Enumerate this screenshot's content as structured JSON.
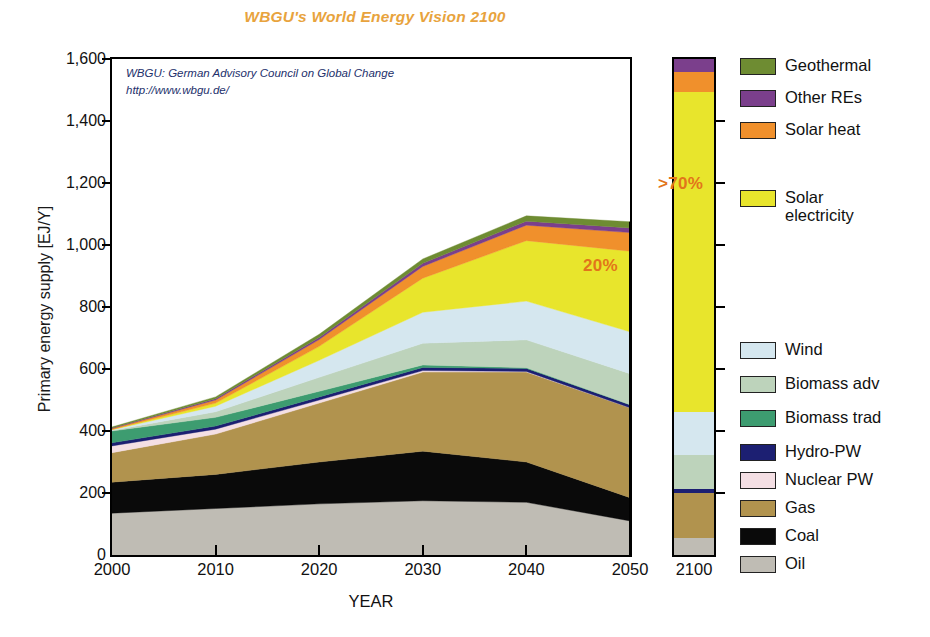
{
  "chart_data": {
    "type": "area",
    "title": "WBGU's World Energy Vision 2100",
    "xlabel": "YEAR",
    "ylabel": "Primary energy supply [EJ/Y]",
    "ylim": [
      0,
      1600
    ],
    "ytick_labels": [
      "0",
      "200",
      "400",
      "600",
      "800",
      "1,000",
      "1,200",
      "1,400",
      "1,600"
    ],
    "ytick_values": [
      0,
      200,
      400,
      600,
      800,
      1000,
      1200,
      1400,
      1600
    ],
    "xtick_labels": [
      "2000",
      "2010",
      "2020",
      "2030",
      "2040",
      "2050"
    ],
    "x": [
      2000,
      2010,
      2020,
      2030,
      2040,
      2050
    ],
    "grid": false,
    "legend_position": "right",
    "stack_order_bottom_to_top": [
      "Oil",
      "Coal",
      "Gas",
      "Nuclear PW",
      "Hydro-PW",
      "Biomass trad",
      "Biomass adv",
      "Wind",
      "Solar electricity",
      "Solar heat",
      "Other REs",
      "Geothermal"
    ],
    "series": [
      {
        "name": "Oil",
        "color": "#bfbcb4",
        "values": [
          135,
          150,
          165,
          175,
          170,
          110
        ]
      },
      {
        "name": "Coal",
        "color": "#0a0a0a",
        "values": [
          100,
          110,
          135,
          160,
          130,
          75
        ]
      },
      {
        "name": "Gas",
        "color": "#b1934e",
        "values": [
          95,
          130,
          190,
          255,
          290,
          290
        ]
      },
      {
        "name": "Nuclear PW",
        "color": "#f4dfe4",
        "values": [
          22,
          16,
          10,
          5,
          2,
          0
        ]
      },
      {
        "name": "Hydro-PW",
        "color": "#1c1f72",
        "values": [
          10,
          10,
          10,
          10,
          10,
          10
        ]
      },
      {
        "name": "Biomass trad",
        "color": "#3d9c70",
        "values": [
          38,
          28,
          18,
          8,
          2,
          0
        ]
      },
      {
        "name": "Biomass adv",
        "color": "#bdd3bb",
        "values": [
          2,
          18,
          45,
          70,
          90,
          100
        ]
      },
      {
        "name": "Wind",
        "color": "#d5e7ef",
        "values": [
          2,
          18,
          55,
          100,
          125,
          135
        ]
      },
      {
        "name": "Solar electricity",
        "color": "#e8e52c",
        "values": [
          1,
          10,
          45,
          110,
          195,
          260
        ]
      },
      {
        "name": "Solar heat",
        "color": "#f0902c",
        "values": [
          3,
          10,
          22,
          38,
          50,
          60
        ]
      },
      {
        "name": "Other REs",
        "color": "#7b3f8c",
        "values": [
          2,
          4,
          7,
          10,
          13,
          15
        ]
      },
      {
        "name": "Geothermal",
        "color": "#6e8c32",
        "values": [
          3,
          6,
          10,
          14,
          17,
          20
        ]
      }
    ],
    "bar_2100": {
      "label": "2100",
      "total": 1560,
      "segments_bottom_to_top": [
        {
          "name": "Oil",
          "color": "#bfbcb4",
          "value": 55
        },
        {
          "name": "Gas",
          "color": "#b1934e",
          "value": 145
        },
        {
          "name": "Hydro-PW",
          "color": "#1c1f72",
          "value": 12
        },
        {
          "name": "Biomass adv",
          "color": "#bdd3bb",
          "value": 110
        },
        {
          "name": "Wind",
          "color": "#d5e7ef",
          "value": 140
        },
        {
          "name": "Solar electricity",
          "color": "#e8e52c",
          "value": 1030
        },
        {
          "name": "Solar heat",
          "color": "#f0902c",
          "value": 65
        },
        {
          "name": "Other REs",
          "color": "#7b3f8c",
          "value": 45
        },
        {
          "name": "Geothermal",
          "color": "#6e8c32",
          "value": 42
        }
      ]
    },
    "annotations": [
      {
        "name": "share-2050",
        "text": "20%",
        "color": "#e2751a"
      },
      {
        "name": "share-2100",
        "text": ">70%",
        "color": "#e2751a"
      }
    ],
    "source_note": {
      "line1": "WBGU: German Advisory Council on Global Change",
      "line2": "http://www.wbgu.de/",
      "color": "#23306b"
    }
  },
  "legend": {
    "items": [
      {
        "label": "Geothermal",
        "color": "#6e8c32"
      },
      {
        "label": "Other REs",
        "color": "#7b3f8c"
      },
      {
        "label": "Solar heat",
        "color": "#f0902c"
      },
      {
        "label": "Solar electricity",
        "color": "#e8e52c"
      },
      {
        "label": "Wind",
        "color": "#d5e7ef"
      },
      {
        "label": "Biomass adv",
        "color": "#bdd3bb"
      },
      {
        "label": "Biomass trad",
        "color": "#3d9c70"
      },
      {
        "label": "Hydro-PW",
        "color": "#1c1f72"
      },
      {
        "label": "Nuclear PW",
        "color": "#f4dfe4"
      },
      {
        "label": "Gas",
        "color": "#b1934e"
      },
      {
        "label": "Coal",
        "color": "#0a0a0a"
      },
      {
        "label": "Oil",
        "color": "#bfbcb4"
      }
    ]
  }
}
